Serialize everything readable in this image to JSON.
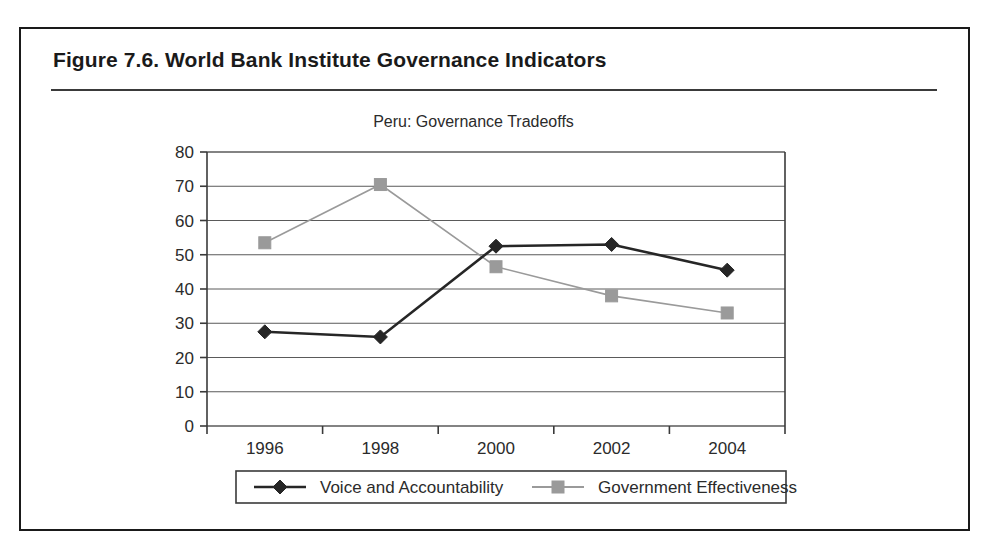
{
  "figure": {
    "caption": "Figure 7.6.  World Bank Institute Governance Indicators"
  },
  "chart_data": {
    "type": "line",
    "title": "Peru: Governance Tradeoffs",
    "xlabel": "",
    "ylabel": "",
    "categories": [
      "1996",
      "1998",
      "2000",
      "2002",
      "2004"
    ],
    "x": [
      1996,
      1998,
      2000,
      2002,
      2004
    ],
    "ylim": [
      0,
      80
    ],
    "ytick_labels": [
      "0",
      "10",
      "20",
      "30",
      "40",
      "50",
      "60",
      "70",
      "80"
    ],
    "yticks": [
      0,
      10,
      20,
      30,
      40,
      50,
      60,
      70,
      80
    ],
    "grid": true,
    "grid_axis": "y",
    "legend_position": "bottom",
    "series": [
      {
        "name": "Voice and Accountability",
        "values": [
          27.5,
          26,
          52.5,
          53,
          45.5
        ],
        "color": "#262626",
        "marker": "diamond"
      },
      {
        "name": "Government Effectiveness",
        "values": [
          53.5,
          70.5,
          46.5,
          38,
          33
        ],
        "color": "#9a9a9a",
        "marker": "square"
      }
    ]
  },
  "legend": {
    "items": [
      {
        "label": "Voice and Accountability",
        "marker": "diamond-marker",
        "color": "#262626"
      },
      {
        "label": "Government Effectiveness",
        "marker": "square-marker",
        "color": "#9a9a9a"
      }
    ]
  }
}
